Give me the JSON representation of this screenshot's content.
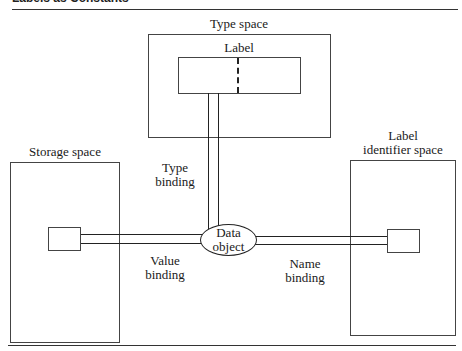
{
  "header": {
    "cut_off_title": "Labels as Constants"
  },
  "diagram": {
    "type_space": {
      "title": "Type space",
      "inner_label": "Label"
    },
    "storage_space": {
      "title": "Storage space"
    },
    "label_identifier_space": {
      "title_line1": "Label",
      "title_line2": "identifier space"
    },
    "data_object": {
      "line1": "Data",
      "line2": "object"
    },
    "bindings": {
      "type": {
        "line1": "Type",
        "line2": "binding"
      },
      "value": {
        "line1": "Value",
        "line2": "binding"
      },
      "name": {
        "line1": "Name",
        "line2": "binding"
      }
    }
  }
}
